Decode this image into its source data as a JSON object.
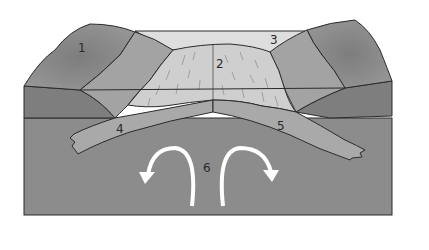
{
  "diagram": {
    "type": "geologic-block-cross-section",
    "labels": [
      {
        "id": "1",
        "text": "1",
        "x": 78,
        "y": 52
      },
      {
        "id": "2",
        "text": "2",
        "x": 216,
        "y": 68
      },
      {
        "id": "3",
        "text": "3",
        "x": 272,
        "y": 44
      },
      {
        "id": "4",
        "text": "4",
        "x": 120,
        "y": 133
      },
      {
        "id": "5",
        "text": "5",
        "x": 281,
        "y": 130
      },
      {
        "id": "6",
        "text": "6",
        "x": 207,
        "y": 172
      }
    ],
    "arrows": [
      {
        "name": "convection-arrow-left",
        "direction": "counterclockwise-down-left"
      },
      {
        "name": "convection-arrow-right",
        "direction": "clockwise-down-right"
      }
    ],
    "colors": {
      "mountain_dark": "#8a8a8a",
      "mountain_mid": "#9e9e9e",
      "slope_light": "#b4b4b4",
      "crest_light": "#cfcfcf",
      "sky_band": "#dedede",
      "crust_dark": "#7e7e7e",
      "mantle": "#8c8c8c",
      "slab": "#a9a9a9",
      "outline": "#2b2b2b",
      "arrow": "#ffffff"
    }
  }
}
